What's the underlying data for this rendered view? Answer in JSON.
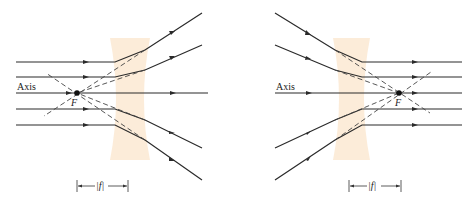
{
  "figure": {
    "left_panel": {
      "axis_label": "Axis",
      "focal_label": "F",
      "measure_label": "|f|",
      "description": "Parallel rays diverge after diverging lens; extensions meet at F on incoming side"
    },
    "right_panel": {
      "axis_label": "Axis",
      "focal_label": "F",
      "measure_label": "|f|",
      "description": "Converging rays aimed at F emerge parallel after diverging lens"
    },
    "colors": {
      "lens": "#fbe7cf",
      "ray": "#2a2a2a"
    }
  }
}
